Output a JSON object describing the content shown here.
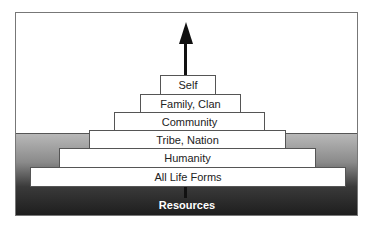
{
  "diagram": {
    "type": "stacked-pyramid",
    "direction_arrow": "up",
    "tiers_top_to_bottom": [
      {
        "label": "Self"
      },
      {
        "label": "Family, Clan"
      },
      {
        "label": "Community"
      },
      {
        "label": "Tribe, Nation"
      },
      {
        "label": "Humanity"
      },
      {
        "label": "All Life Forms"
      }
    ],
    "base_label": "Resources",
    "colors": {
      "frame_border": "#777777",
      "tier_fill": "#ffffff",
      "tier_border": "#555555",
      "ground_top": "#b8b8b8",
      "ground_bottom": "#1e1e1e",
      "arrow": "#111111",
      "base_label_text": "#ffffff"
    }
  }
}
